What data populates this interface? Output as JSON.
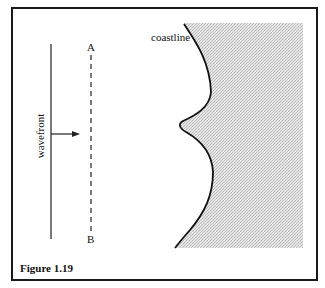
{
  "figure": {
    "caption": "Figure 1.19",
    "labels": {
      "wavefront": "wavefront",
      "point_a": "A",
      "point_b": "B",
      "coastline": "coastline"
    },
    "colors": {
      "line": "#111111",
      "land_fill": "#d9d9d9",
      "frame": "#1a1a1a"
    }
  }
}
